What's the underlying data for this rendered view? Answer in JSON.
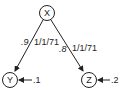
{
  "nodes": [
    {
      "id": "X",
      "label": "X"
    },
    {
      "id": "Y",
      "label": "Y"
    },
    {
      "id": "Z",
      "label": "Z"
    }
  ],
  "edges": [
    {
      "from": "X",
      "to": "Y",
      "weight": ".9",
      "date": "1/1/71"
    },
    {
      "from": "X",
      "to": "Z",
      "weight": ".8",
      "date": "1/1/71"
    }
  ],
  "inputs": [
    {
      "to": "Y",
      "value": ".1"
    },
    {
      "to": "Z",
      "value": ".2"
    }
  ],
  "colors": {
    "stroke": "#222222",
    "background": "#ffffff"
  }
}
